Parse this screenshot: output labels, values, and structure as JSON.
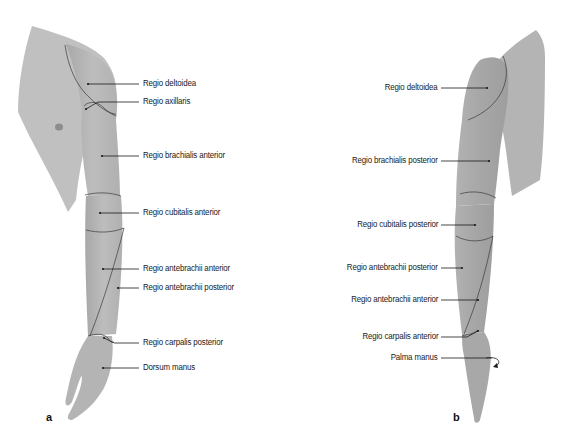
{
  "figure": {
    "colors": {
      "skin": "#b8b8b8",
      "skin_dark": "#a9a9a9",
      "skin_light": "#c6c6c6",
      "outline": "#3a3a3a",
      "leader": "#1a1a1a",
      "text": "#1a1a1a",
      "background": "#ffffff"
    },
    "panels": [
      {
        "id": "a",
        "letter": "a",
        "letter_pos": [
          46,
          420
        ],
        "labels": [
          {
            "text": "Regio deltoidea",
            "x": 143,
            "y": 84,
            "dot": [
              88,
              84
            ],
            "line_end": 139
          },
          {
            "text": "Regio axillaris",
            "x": 143,
            "y": 102,
            "dot": [
              86,
              109
            ],
            "line_end": 139
          },
          {
            "text": "Regio brachialis anterior",
            "x": 143,
            "y": 156,
            "dot": [
              102,
              156
            ],
            "line_end": 139
          },
          {
            "text": "Regio cubitalis anterior",
            "x": 143,
            "y": 213,
            "dot": [
              100,
              213
            ],
            "line_end": 139
          },
          {
            "text": "Regio antebrachii anterior",
            "x": 143,
            "y": 269,
            "dot": [
              103,
              269
            ],
            "line_end": 139
          },
          {
            "text": "Regio antebrachii posterior",
            "x": 143,
            "y": 288,
            "dot": [
              118,
              288
            ],
            "line_end": 139
          },
          {
            "text": "Regio carpalis posterior",
            "x": 143,
            "y": 343,
            "dot": [
              104,
              338
            ],
            "line_end": 139
          },
          {
            "text": "Dorsum manus",
            "x": 143,
            "y": 368,
            "dot": [
              103,
              368
            ],
            "line_end": 139
          }
        ]
      },
      {
        "id": "b",
        "letter": "b",
        "letter_pos": [
          453,
          420
        ],
        "labels": [
          {
            "text": "Regio deltoidea",
            "x": 440,
            "y": 88,
            "dot": [
              487,
              88
            ],
            "line_start": 441
          },
          {
            "text": "Regio brachialis posterior",
            "x": 440,
            "y": 161,
            "dot": [
              489,
              161
            ],
            "line_start": 441
          },
          {
            "text": "Regio cubitalis posterior",
            "x": 440,
            "y": 225,
            "dot": [
              475,
              225
            ],
            "line_start": 441
          },
          {
            "text": "Regio antebrachii posterior",
            "x": 440,
            "y": 268,
            "dot": [
              462,
              268
            ],
            "line_start": 441
          },
          {
            "text": "Regio antebrachii anterior",
            "x": 440,
            "y": 300,
            "dot": [
              478,
              300
            ],
            "line_start": 441
          },
          {
            "text": "Regio carpalis anterior",
            "x": 440,
            "y": 337,
            "dot": [
              478,
              331
            ],
            "line_start": 441
          },
          {
            "text": "Palma manus",
            "x": 440,
            "y": 358,
            "dot": [
              492,
              358
            ],
            "line_start": 441
          }
        ]
      }
    ]
  }
}
